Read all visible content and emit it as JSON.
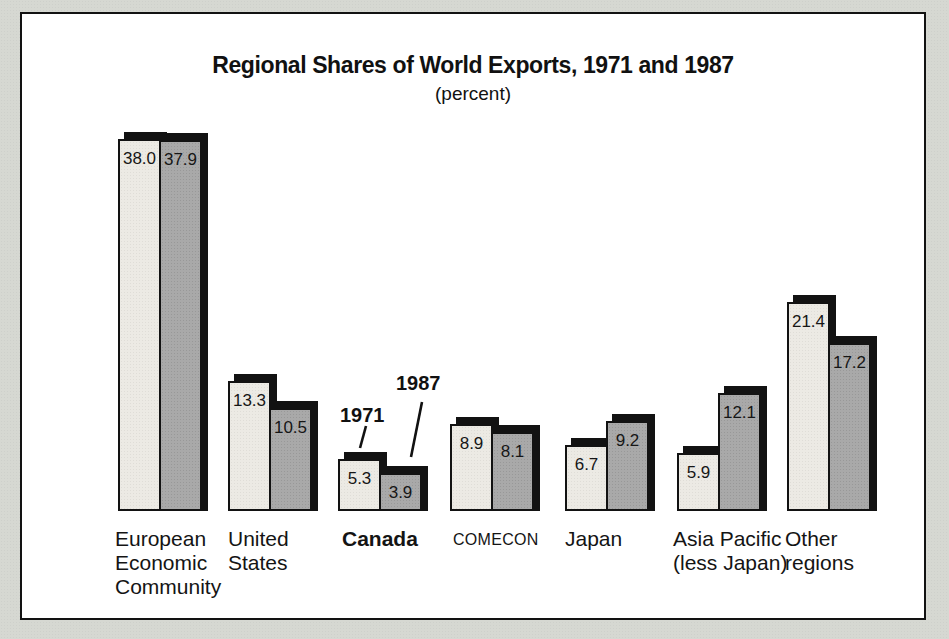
{
  "page": {
    "background": "#d6d8d2"
  },
  "frame": {
    "background": "#ffffff",
    "border_color": "#121212"
  },
  "chart_data": {
    "type": "bar",
    "title": "Regional Shares of World Exports, 1971 and 1987",
    "subtitle": "(percent)",
    "unit": "percent",
    "categories": [
      {
        "label": "European Economic Community",
        "lines": [
          "European",
          "Economic",
          "Community"
        ]
      },
      {
        "label": "United States",
        "lines": [
          "United",
          "States"
        ]
      },
      {
        "label": "Canada",
        "lines": [
          "Canada"
        ],
        "bold": true
      },
      {
        "label": "COMECON",
        "lines": [
          "COMECON"
        ],
        "small": true
      },
      {
        "label": "Japan",
        "lines": [
          "Japan"
        ]
      },
      {
        "label": "Asia Pacific (less Japan)",
        "lines": [
          "Asia Pacific",
          "(less Japan)"
        ]
      },
      {
        "label": "Other regions",
        "lines": [
          "Other",
          "regions"
        ]
      }
    ],
    "series": [
      {
        "name": "1971",
        "color": "#eceae4",
        "values": [
          38.0,
          13.3,
          5.3,
          8.9,
          6.7,
          5.9,
          21.4
        ]
      },
      {
        "name": "1987",
        "color": "#a9a9a9",
        "values": [
          37.9,
          10.5,
          3.9,
          8.1,
          9.2,
          12.1,
          17.2
        ]
      }
    ],
    "value_labels_shown": true,
    "value_label_format": "one_decimal",
    "annotations": [
      {
        "text": "1971",
        "points_to": "Canada 1971 bar"
      },
      {
        "text": "1987",
        "points_to": "Canada 1987 bar"
      }
    ],
    "axes": {
      "y_axis_shown": false,
      "x_axis_shown": false,
      "grid": false
    },
    "shadow_color": "#121212",
    "ylim": [
      0,
      40
    ]
  }
}
